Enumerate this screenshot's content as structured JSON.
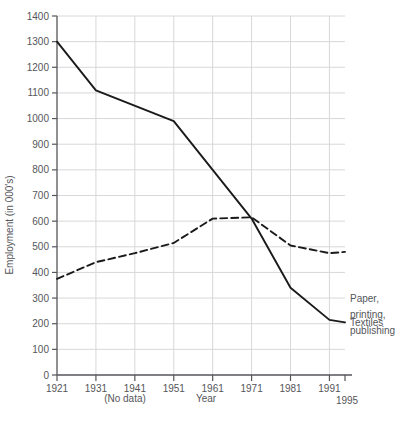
{
  "chart_data": {
    "type": "line",
    "title": "",
    "xlabel": "Year",
    "ylabel": "Employment (in 000's)",
    "xlim": [
      1921,
      1995
    ],
    "ylim": [
      0,
      1400
    ],
    "grid": true,
    "legend_position": "right-inline",
    "x": [
      1921,
      1931,
      1941,
      1951,
      1961,
      1971,
      1981,
      1991,
      1995
    ],
    "xtick_labels": [
      "1921",
      "1931",
      "1941",
      "1951",
      "1961",
      "1971",
      "1981",
      "1991",
      "1995"
    ],
    "ytick_labels": [
      "0",
      "100",
      "200",
      "300",
      "400",
      "500",
      "600",
      "700",
      "800",
      "900",
      "1000",
      "1100",
      "1200",
      "1300",
      "1400"
    ],
    "ytick_values": [
      0,
      100,
      200,
      300,
      400,
      500,
      600,
      700,
      800,
      900,
      1000,
      1100,
      1200,
      1300,
      1400
    ],
    "annotations": [
      {
        "name": "no-data-note",
        "text": "(No data)",
        "x": 1941
      }
    ],
    "series": [
      {
        "name": "Textiles",
        "label": "Textiles",
        "style": "solid",
        "color": "#1a1a1a",
        "x": [
          1921,
          1931,
          1951,
          1961,
          1971,
          1981,
          1991,
          1995
        ],
        "values": [
          1300,
          1110,
          990,
          800,
          610,
          340,
          215,
          205
        ]
      },
      {
        "name": "Paper, printing, publishing",
        "label": "Paper,\nprinting,\npublishing",
        "label_lines": [
          "Paper,",
          "printing,",
          "publishing"
        ],
        "style": "dashed",
        "color": "#1a1a1a",
        "x": [
          1921,
          1931,
          1941,
          1951,
          1961,
          1971,
          1981,
          1991,
          1995
        ],
        "values": [
          375,
          440,
          475,
          515,
          610,
          615,
          505,
          475,
          480
        ]
      }
    ]
  },
  "colors": {
    "grid": "#d8d8da",
    "axis": "#55565a",
    "line": "#1a1a1a",
    "text": "#55565a",
    "background": "#ffffff"
  }
}
